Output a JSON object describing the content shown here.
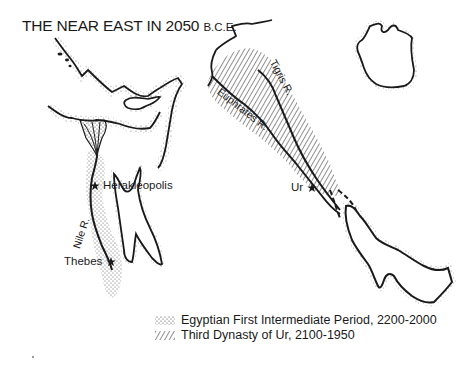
{
  "map": {
    "title": "THE NEAR EAST IN 2050",
    "title_era": "B.C.E.",
    "places": [
      {
        "name": "Herakleopolis",
        "symbol": "star"
      },
      {
        "name": "Thebes",
        "symbol": "star"
      },
      {
        "name": "Ur",
        "symbol": "star"
      }
    ],
    "rivers": [
      {
        "name": "Nile R."
      },
      {
        "name": "Tigris R."
      },
      {
        "name": "Euphrates R."
      }
    ],
    "legend": [
      {
        "pattern": "stipple",
        "label": "Egyptian First Intermediate Period, 2200-2000"
      },
      {
        "pattern": "diagonal-hatch",
        "label": "Third Dynasty of Ur, 2100-1950"
      }
    ],
    "colors": {
      "ink": "#1a1a1a",
      "background": "#ffffff"
    }
  }
}
